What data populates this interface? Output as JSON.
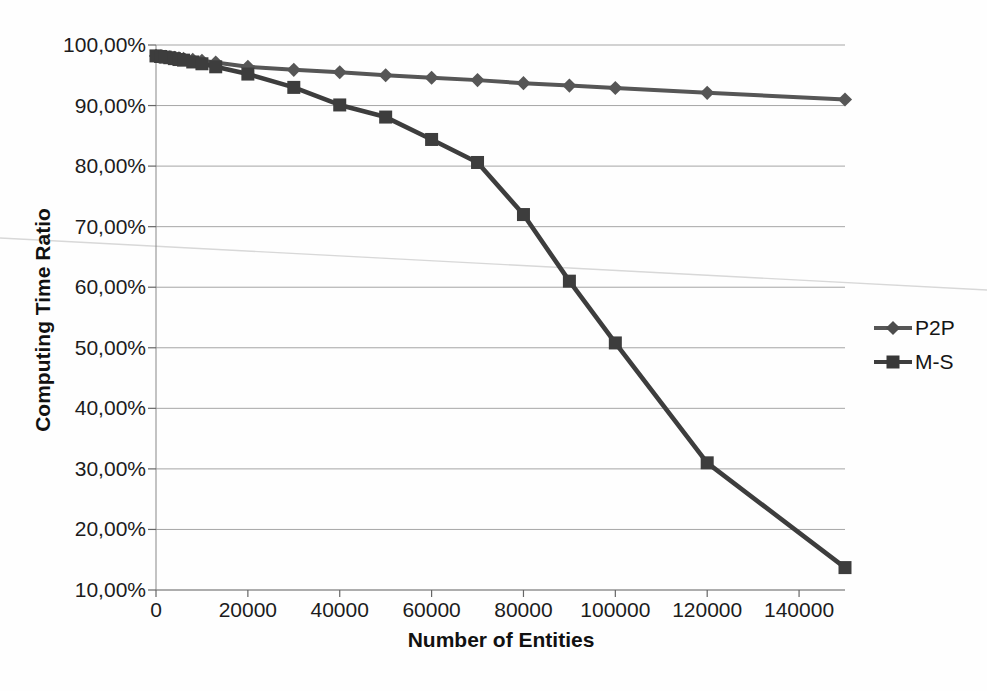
{
  "chart_data": {
    "type": "line",
    "title": "",
    "xlabel": "Number of Entities",
    "ylabel": "Computing Time Ratio",
    "xlim": [
      0,
      150000
    ],
    "ylim": [
      10,
      100
    ],
    "grid": true,
    "legend_position": "right",
    "x_tick_values": [
      0,
      20000,
      40000,
      60000,
      80000,
      100000,
      120000,
      140000
    ],
    "x_tick_labels": [
      "0",
      "20000",
      "40000",
      "60000",
      "80000",
      "100000",
      "120000",
      "140000"
    ],
    "y_tick_values": [
      100,
      90,
      80,
      70,
      60,
      50,
      40,
      30,
      20,
      10
    ],
    "y_tick_labels": [
      "100,00%",
      "90,00%",
      "80,00%",
      "70,00%",
      "60,00%",
      "50,00%",
      "40,00%",
      "30,00%",
      "20,00%",
      "10,00%"
    ],
    "x": [
      0,
      1000,
      2000,
      3000,
      4000,
      5000,
      6000,
      8000,
      10000,
      13000,
      20000,
      30000,
      40000,
      50000,
      60000,
      70000,
      80000,
      90000,
      100000,
      120000,
      150000
    ],
    "series": [
      {
        "name": "P2P",
        "marker": "diamond",
        "color": "#565656",
        "values": [
          98.2,
          98.1,
          98.05,
          97.95,
          97.9,
          97.8,
          97.7,
          97.55,
          97.4,
          97.1,
          96.4,
          95.9,
          95.5,
          95.0,
          94.6,
          94.2,
          93.7,
          93.3,
          92.9,
          92.1,
          91.0
        ]
      },
      {
        "name": "M-S",
        "marker": "square",
        "color": "#3d3d3d",
        "values": [
          98.2,
          98.1,
          98.0,
          97.9,
          97.75,
          97.6,
          97.5,
          97.2,
          96.9,
          96.4,
          95.2,
          93.0,
          90.1,
          88.1,
          84.4,
          80.6,
          72.0,
          61.0,
          50.8,
          31.0,
          13.7
        ]
      }
    ]
  },
  "colors": {
    "gridline": "#a6a6a6",
    "axis": "#888888",
    "tick_text": "#1c1c1c",
    "scan_artifact": "#d8d8d8",
    "background": "#fefefe"
  }
}
